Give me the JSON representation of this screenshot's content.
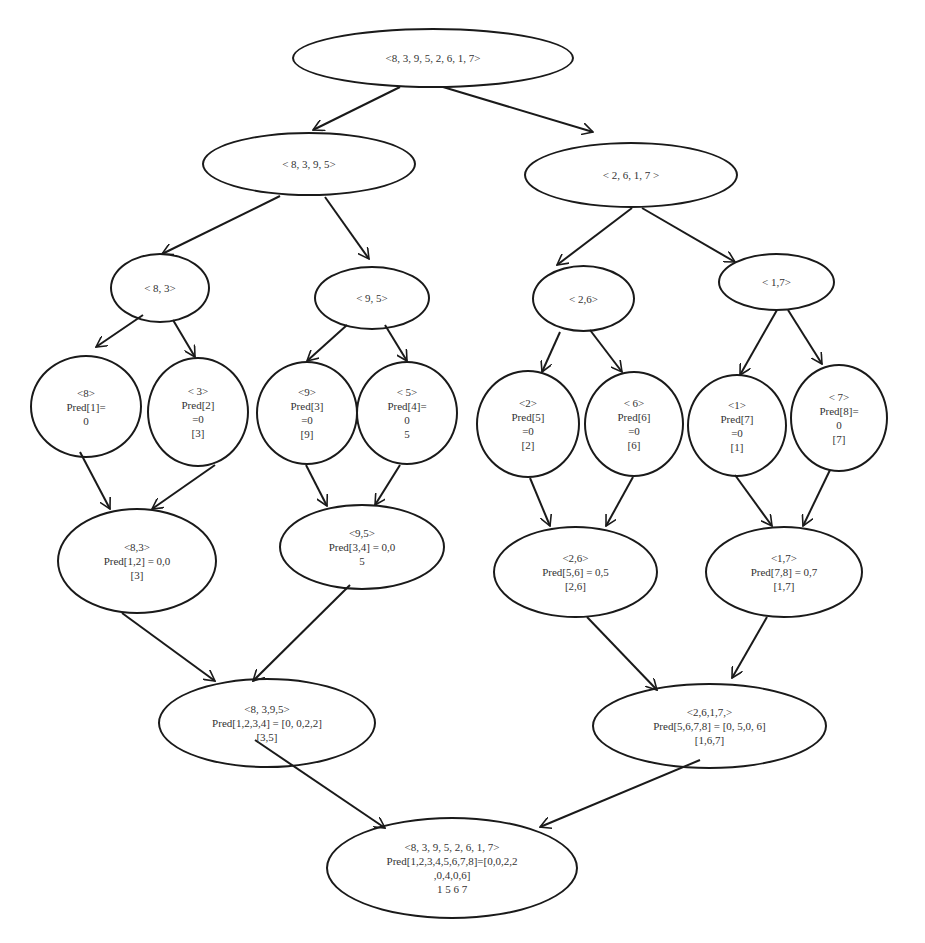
{
  "diagram": {
    "type": "merge-sort-predecessor-tree",
    "nodes": {
      "root": {
        "lines": [
          "<8, 3, 9, 5, 2, 6, 1, 7>"
        ]
      },
      "left": {
        "lines": [
          "< 8, 3, 9, 5>"
        ]
      },
      "right": {
        "lines": [
          "< 2, 6, 1, 7 >"
        ]
      },
      "l83": {
        "lines": [
          "< 8, 3>"
        ]
      },
      "l95": {
        "lines": [
          "< 9, 5>"
        ]
      },
      "r26": {
        "lines": [
          "< 2,6>"
        ]
      },
      "r17": {
        "lines": [
          "< 1,7>"
        ]
      },
      "leaf8": {
        "lines": [
          "<8>",
          "Pred[1]=",
          "0"
        ]
      },
      "leaf3": {
        "lines": [
          "< 3>",
          "Pred[2]",
          "=0",
          "[3]"
        ]
      },
      "leaf9": {
        "lines": [
          "<9>",
          "Pred[3]",
          "=0",
          "[9]"
        ]
      },
      "leaf5": {
        "lines": [
          "< 5>",
          "Pred[4]=",
          "0",
          "5"
        ]
      },
      "leaf2": {
        "lines": [
          "<2>",
          "Pred[5]",
          "=0",
          "[2]"
        ]
      },
      "leaf6": {
        "lines": [
          "< 6>",
          "Pred[6]",
          "=0",
          "[6]"
        ]
      },
      "leaf1": {
        "lines": [
          "<1>",
          "Pred[7]",
          "=0",
          "[1]"
        ]
      },
      "leaf7": {
        "lines": [
          "< 7>",
          "Pred[8]=",
          "0",
          "[7]"
        ]
      },
      "m83": {
        "lines": [
          "<8,3>",
          "Pred[1,2] = 0,0",
          "[3]"
        ]
      },
      "m95": {
        "lines": [
          "<9,5>",
          "Pred[3,4] = 0,0",
          "5"
        ]
      },
      "m26": {
        "lines": [
          "<2,6>",
          "Pred[5,6] = 0,5",
          "[2,6]"
        ]
      },
      "m17": {
        "lines": [
          "<1,7>",
          "Pred[7,8] = 0,7",
          "[1,7]"
        ]
      },
      "m8395": {
        "lines": [
          "<8, 3,9,5>",
          "Pred[1,2,3,4] = [0, 0,2,2]",
          "[3,5]"
        ]
      },
      "m2617": {
        "lines": [
          "<2,6,1,7,>",
          "Pred[5,6,7,8] = [0, 5,0, 6]",
          "[1,6,7]"
        ]
      },
      "final": {
        "lines": [
          "<8, 3, 9, 5, 2, 6, 1, 7>",
          "Pred[1,2,3,4,5,6,7,8]=[0,0,2,2",
          ",0,4,0,6]",
          "1 5 6 7"
        ]
      }
    },
    "edges": [
      [
        "root",
        "left"
      ],
      [
        "root",
        "right"
      ],
      [
        "left",
        "l83"
      ],
      [
        "left",
        "l95"
      ],
      [
        "right",
        "r26"
      ],
      [
        "right",
        "r17"
      ],
      [
        "l83",
        "leaf8"
      ],
      [
        "l83",
        "leaf3"
      ],
      [
        "l95",
        "leaf9"
      ],
      [
        "l95",
        "leaf5"
      ],
      [
        "r26",
        "leaf2"
      ],
      [
        "r26",
        "leaf6"
      ],
      [
        "r17",
        "leaf1"
      ],
      [
        "r17",
        "leaf7"
      ],
      [
        "leaf8",
        "m83"
      ],
      [
        "leaf3",
        "m83"
      ],
      [
        "leaf9",
        "m95"
      ],
      [
        "leaf5",
        "m95"
      ],
      [
        "leaf2",
        "m26"
      ],
      [
        "leaf6",
        "m26"
      ],
      [
        "leaf1",
        "m17"
      ],
      [
        "leaf7",
        "m17"
      ],
      [
        "m83",
        "m8395"
      ],
      [
        "m95",
        "m8395"
      ],
      [
        "m26",
        "m2617"
      ],
      [
        "m17",
        "m2617"
      ],
      [
        "m8395",
        "final"
      ],
      [
        "m2617",
        "final"
      ]
    ]
  }
}
